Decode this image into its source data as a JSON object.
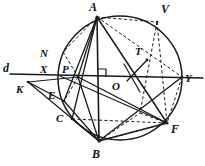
{
  "figure": {
    "stroke_color": "#1a1a1a",
    "background_color": "#ffffff"
  },
  "circle": {
    "cx": 120,
    "cy": 78,
    "r": 62,
    "label": "circumcircle"
  },
  "points": {
    "A": {
      "x": 97,
      "y": 17,
      "label": "A",
      "lx": 89,
      "ly": 3
    },
    "V": {
      "x": 157,
      "y": 22,
      "label": "V",
      "lx": 162,
      "ly": 7
    },
    "N": {
      "x": 66,
      "y": 53,
      "label": "N",
      "lx": 41,
      "ly": 52
    },
    "X": {
      "x": 60,
      "y": 76,
      "label": "X",
      "lx": 40,
      "ly": 66
    },
    "P": {
      "x": 78,
      "y": 77,
      "label": "P",
      "lx": 62,
      "ly": 66
    },
    "T": {
      "x": 145,
      "y": 62,
      "label": "T",
      "lx": 136,
      "ly": 49
    },
    "O": {
      "x": 120,
      "y": 78,
      "label": "O",
      "lx": 113,
      "ly": 80
    },
    "Y": {
      "x": 182,
      "y": 77,
      "label": "Y",
      "lx": 184,
      "ly": 70
    },
    "d": {
      "x": 10,
      "y": 74,
      "label": "d",
      "lx": 4,
      "ly": 62
    },
    "K": {
      "x": 28,
      "y": 82,
      "label": "K",
      "lx": 17,
      "ly": 83
    },
    "E": {
      "x": 64,
      "y": 101,
      "label": "E",
      "lx": 49,
      "ly": 90
    },
    "C": {
      "x": 72,
      "y": 119,
      "label": "C",
      "lx": 57,
      "ly": 113
    },
    "B": {
      "x": 99,
      "y": 141,
      "label": "B",
      "lx": 93,
      "ly": 147
    },
    "F": {
      "x": 167,
      "y": 123,
      "label": "F",
      "lx": 170,
      "ly": 122
    }
  },
  "labels": [
    {
      "name": "point-label-A",
      "text": "A"
    },
    {
      "name": "point-label-V",
      "text": "V"
    },
    {
      "name": "point-label-N",
      "text": "N"
    },
    {
      "name": "point-label-X",
      "text": "X"
    },
    {
      "name": "point-label-P",
      "text": "P"
    },
    {
      "name": "point-label-T",
      "text": "T"
    },
    {
      "name": "point-label-O",
      "text": "O"
    },
    {
      "name": "point-label-Y",
      "text": "Y"
    },
    {
      "name": "line-label-d",
      "text": "d"
    },
    {
      "name": "point-label-K",
      "text": "K"
    },
    {
      "name": "point-label-E",
      "text": "E"
    },
    {
      "name": "point-label-C",
      "text": "C"
    },
    {
      "name": "point-label-B",
      "text": "B"
    },
    {
      "name": "point-label-F",
      "text": "F"
    }
  ],
  "solid_segments": [
    {
      "name": "line-d-KY",
      "from": "d",
      "to": "Y"
    },
    {
      "name": "segment-A-B",
      "from": "A",
      "to": "B"
    },
    {
      "name": "segment-A-F",
      "from": "A",
      "to": "F"
    },
    {
      "name": "segment-A-E",
      "from": "A",
      "to": "E"
    },
    {
      "name": "segment-A-C",
      "from": "A",
      "to": "C"
    },
    {
      "name": "segment-A-P",
      "from": "A",
      "to": "P"
    },
    {
      "name": "segment-K-P",
      "from": "K",
      "to": "P"
    },
    {
      "name": "segment-K-E",
      "from": "K",
      "to": "E"
    },
    {
      "name": "segment-K-B",
      "from": "K",
      "to": "B"
    },
    {
      "name": "segment-P-B",
      "from": "P",
      "to": "B"
    },
    {
      "name": "segment-P-F",
      "from": "P",
      "to": "F"
    },
    {
      "name": "segment-E-B",
      "from": "E",
      "to": "B"
    },
    {
      "name": "segment-C-B",
      "from": "C",
      "to": "B"
    },
    {
      "name": "segment-B-Y",
      "from": "B",
      "to": "Y"
    },
    {
      "name": "segment-B-F",
      "from": "B",
      "to": "F"
    },
    {
      "name": "segment-X-F",
      "from": "X",
      "to": "F"
    }
  ],
  "dashed_segments": [
    {
      "name": "dashed-A-V",
      "from": "A",
      "to": "V"
    },
    {
      "name": "dashed-V-F",
      "from": "V",
      "to": "F"
    },
    {
      "name": "dashed-A-Y",
      "from": "A",
      "to": "Y"
    },
    {
      "name": "dashed-A-N",
      "from": "A",
      "to": "N"
    },
    {
      "name": "dashed-N-P",
      "from": "N",
      "to": "P"
    },
    {
      "name": "dashed-P-E",
      "from": "P",
      "to": "E"
    },
    {
      "name": "dashed-Y-F",
      "from": "Y",
      "to": "F"
    },
    {
      "name": "dashed-C-F",
      "from": "C",
      "to": "F"
    },
    {
      "name": "dashed-B-F-upper",
      "from": "B",
      "to": "F"
    },
    {
      "name": "dashed-A-F2",
      "from": "A",
      "to": "F"
    }
  ],
  "markers": {
    "right_angle": {
      "name": "right-angle-marker",
      "x": 98,
      "y": 69,
      "size": 8
    },
    "tangent_tick": {
      "name": "tangent-segment-T",
      "x1": 128,
      "y1": 80,
      "x2": 147,
      "y2": 60
    }
  },
  "chord_AB_foot": {
    "x": 99,
    "y": 77
  }
}
